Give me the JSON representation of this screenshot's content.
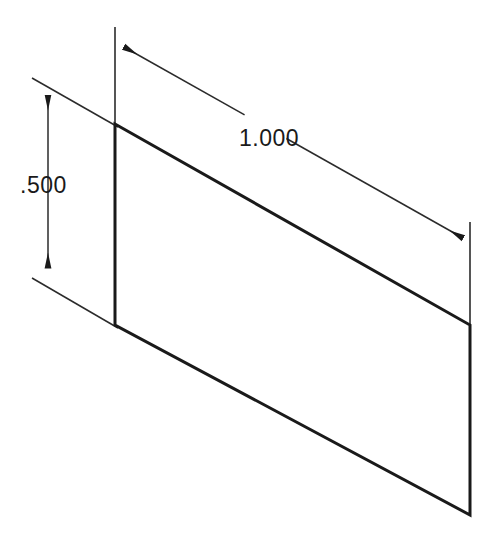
{
  "drawing": {
    "type": "isometric-cad-view",
    "background_color": "#ffffff",
    "line_color": "#1a1a1a",
    "dimension_line_color": "#2b2b2b",
    "part": {
      "name": "rectangular-plate",
      "shape": "parallelogram",
      "vertices": {
        "top_left": [
          115,
          124
        ],
        "top_right": [
          470,
          325
        ],
        "bottom_right": [
          470,
          515
        ],
        "bottom_left": [
          115,
          325
        ]
      },
      "edge_width": 3
    },
    "dimensions": [
      {
        "id": "width-dimension",
        "label": "1.000",
        "orientation": "isometric-top",
        "text_position": [
          239,
          146
        ],
        "line_start": [
          124,
          47
        ],
        "line_end": [
          463,
          238
        ],
        "arrow_start": [
          124,
          47
        ],
        "arrow_end": [
          463,
          238
        ],
        "extension_line_1": {
          "x1": 115,
          "y1": 27,
          "x2": 115,
          "y2": 140
        },
        "extension_line_2": {
          "x1": 470,
          "y1": 222,
          "x2": 470,
          "y2": 340
        }
      },
      {
        "id": "height-dimension",
        "label": ".500",
        "orientation": "vertical",
        "text_position": [
          20,
          193
        ],
        "line_start": [
          48,
          95
        ],
        "line_end": [
          48,
          268
        ],
        "arrow_start": [
          48,
          95
        ],
        "arrow_end": [
          48,
          268
        ],
        "extension_line_1": {
          "x1": 32,
          "y1": 78,
          "x2": 118,
          "y2": 127
        },
        "extension_line_2": {
          "x1": 32,
          "y1": 278,
          "x2": 118,
          "y2": 328
        }
      }
    ],
    "arrowheads": {
      "style": "solid-filled-narrow",
      "length": 16,
      "half_width": 3.5
    }
  }
}
